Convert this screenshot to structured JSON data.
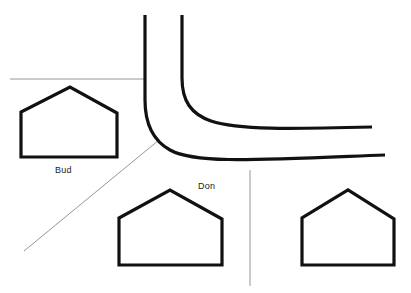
{
  "scene": {
    "title": "Neighborhood plot sketch",
    "width": 411,
    "height": 293,
    "background_color": "#ffffff",
    "stroke_color": "#111111",
    "thin_line_color": "#8a8a8a"
  },
  "labels": {
    "bud": "Bud",
    "don": "Don"
  },
  "roads": [
    {
      "name": "road-outer-edge",
      "description": "Outer curb of the curving road, enters top and exits right",
      "stroke_width": 3.2,
      "path": "M 145 15 L 145 100 C 145 123 152 140 170 150 C 195 164 255 160 385 155"
    },
    {
      "name": "road-inner-edge",
      "description": "Inner curb of the curving road, enters top and exits right",
      "stroke_width": 3.2,
      "path": "M 182 15 L 182 78 C 182 101 191 114 211 121 C 238 130 290 129 372 127"
    }
  ],
  "property_lines": [
    {
      "name": "lot-line-horizontal-north",
      "stroke_width": 0.9,
      "path": "M 10 79 L 146 79"
    },
    {
      "name": "lot-line-diagonal-southwest",
      "stroke_width": 0.9,
      "path": "M 24 251 L 159 140"
    },
    {
      "name": "lot-line-vertical-south",
      "stroke_width": 0.9,
      "path": "M 250 170 L 250 286"
    }
  ],
  "houses": [
    {
      "name": "house-bud",
      "owner": "Bud",
      "stroke_width": 3.2,
      "path": "M 21 157 L 21 112 L 70 87 L 117 113 L 117 157 Z"
    },
    {
      "name": "house-don",
      "owner": "Don",
      "stroke_width": 3.2,
      "path": "M 119 265 L 119 218 L 170 190 L 222 219 L 222 265 Z"
    },
    {
      "name": "house-unlabeled-east",
      "owner": "",
      "stroke_width": 3.2,
      "path": "M 302 265 L 302 218 L 348 190 L 394 219 L 394 265 Z"
    }
  ]
}
